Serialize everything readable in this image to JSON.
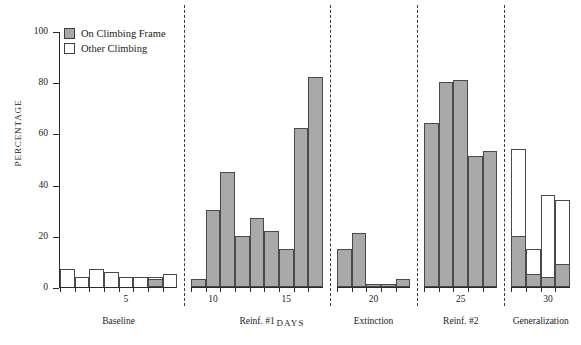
{
  "chart_data": {
    "type": "bar",
    "title": "",
    "xlabel": "DAYS",
    "ylabel": "PERCENTAGE",
    "ylim": [
      0,
      100
    ],
    "yticks": [
      0,
      20,
      40,
      60,
      80,
      100
    ],
    "xticks": [
      5,
      10,
      15,
      20,
      25,
      30
    ],
    "grid": false,
    "legend_position": "top-left",
    "stacked": true,
    "legend": [
      {
        "name": "On Climbing Frame",
        "color": "#a9a9a9",
        "style": "filled"
      },
      {
        "name": "Other Climbing",
        "color": "#ffffff",
        "style": "outline"
      }
    ],
    "series": [
      {
        "name": "On Climbing Frame",
        "color": "#a9a9a9"
      },
      {
        "name": "Other Climbing",
        "color": "#ffffff"
      }
    ],
    "phases": [
      {
        "label": "Baseline",
        "days": [
          1,
          2,
          3,
          4,
          5,
          6,
          7,
          8
        ],
        "on_climbing_frame": [
          0,
          0,
          0,
          0,
          0,
          0,
          3,
          0
        ],
        "other_climbing": [
          7,
          4,
          7,
          6,
          4,
          4,
          1,
          5
        ]
      },
      {
        "label": "Reinf. #1",
        "days": [
          9,
          10,
          11,
          12,
          13,
          14,
          15,
          16,
          17
        ],
        "on_climbing_frame": [
          3,
          30,
          45,
          20,
          27,
          22,
          15,
          62,
          82
        ],
        "other_climbing": [
          0,
          0,
          0,
          0,
          0,
          0,
          0,
          0,
          0
        ]
      },
      {
        "label": "Extinction",
        "days": [
          18,
          19,
          20,
          21,
          22
        ],
        "on_climbing_frame": [
          15,
          21,
          1,
          1,
          3
        ],
        "other_climbing": [
          0,
          0,
          0,
          0,
          0
        ]
      },
      {
        "label": "Reinf. #2",
        "days": [
          23,
          24,
          25,
          26,
          27
        ],
        "on_climbing_frame": [
          64,
          80,
          81,
          51,
          53
        ],
        "other_climbing": [
          0,
          0,
          0,
          0,
          0
        ]
      },
      {
        "label": "Generalization",
        "days": [
          28,
          29,
          30,
          31
        ],
        "on_climbing_frame": [
          20,
          5,
          4,
          9
        ],
        "other_climbing": [
          34,
          10,
          32,
          25
        ]
      }
    ]
  },
  "axes": {
    "y_label": "PERCENTAGE",
    "x_label": "DAYS",
    "y_tick_labels": [
      "0",
      "20",
      "40",
      "60",
      "80",
      "100"
    ],
    "x_tick_labels": [
      "5",
      "10",
      "15",
      "20",
      "25",
      "30"
    ]
  },
  "legend": {
    "items": [
      {
        "label": "On Climbing Frame"
      },
      {
        "label": "Other Climbing"
      }
    ]
  },
  "phase_labels": [
    "Baseline",
    "Reinf. #1",
    "Extinction",
    "Reinf. #2",
    "Generalization"
  ]
}
